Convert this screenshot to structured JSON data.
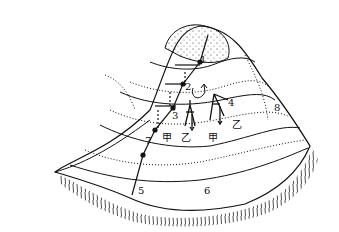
{
  "diagram": {
    "type": "contour-hill-sketch",
    "stroke_color": "#111111",
    "background": "#ffffff",
    "points": [
      {
        "id": "1",
        "label": "1",
        "x": 200,
        "y": 62
      },
      {
        "id": "2",
        "label": "2",
        "x": 183,
        "y": 89
      },
      {
        "id": "3",
        "label": "3",
        "x": 172,
        "y": 116
      },
      {
        "id": "4",
        "label": "4",
        "x": 229,
        "y": 103
      },
      {
        "id": "5",
        "label": "5",
        "x": 138,
        "y": 191
      },
      {
        "id": "6",
        "label": "6",
        "x": 204,
        "y": 191
      },
      {
        "id": "7",
        "label": "7",
        "x": 146,
        "y": 143
      },
      {
        "id": "8",
        "label": "8",
        "x": 275,
        "y": 107
      }
    ],
    "chinese_labels": [
      {
        "id": "jia-1",
        "label": "甲",
        "x": 163,
        "y": 139
      },
      {
        "id": "yi-1",
        "label": "乙",
        "x": 182,
        "y": 139
      },
      {
        "id": "jia-2",
        "label": "甲",
        "x": 209,
        "y": 139
      },
      {
        "id": "yi-2",
        "label": "乙",
        "x": 233,
        "y": 125
      }
    ],
    "annotations": [
      {
        "id": "curved-arrow",
        "description": "curved arrow near point 2"
      },
      {
        "id": "tripod-figure-1",
        "description": "surveying figure between 3 and 4"
      },
      {
        "id": "tripod-figure-2",
        "description": "surveying figure near point 4"
      }
    ]
  }
}
